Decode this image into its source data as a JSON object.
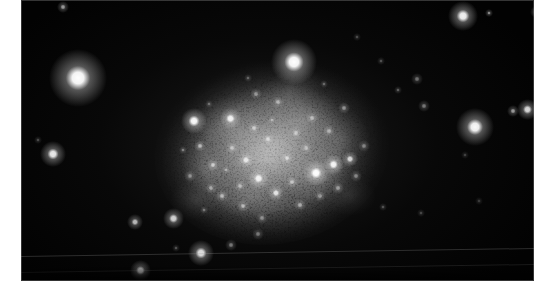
{
  "image": {
    "kind": "astronomical-photograph",
    "subject": "irregular dwarf galaxy resolved into individual stars",
    "caption": "",
    "width": 547,
    "height": 297,
    "colors": {
      "paper": "#ffffff",
      "sky": "#000000",
      "star": "#ffffff",
      "nebulosity": "#9a9a9a"
    }
  },
  "plate": {
    "left": 21,
    "top": 0,
    "width": 513,
    "height": 281
  },
  "chart_data": {
    "type": "scatter",
    "title": "",
    "xlabel": "",
    "ylabel": "",
    "xlim": [
      21,
      534
    ],
    "ylim": [
      0,
      281
    ],
    "grid": false,
    "legend": "none",
    "galaxy": {
      "name": "irregular dwarf galaxy",
      "center_x": 272,
      "center_y": 150,
      "semi_major_x": 105,
      "semi_minor_y": 82,
      "position_angle_deg": -12,
      "peak_surface_brightness": 0.42
    },
    "halos": [
      {
        "cx": 272,
        "cy": 150,
        "rx": 112,
        "ry": 88,
        "b": 0.2,
        "rot": -12
      },
      {
        "cx": 268,
        "cy": 148,
        "rx": 86,
        "ry": 66,
        "b": 0.26,
        "rot": -10
      },
      {
        "cx": 276,
        "cy": 146,
        "rx": 60,
        "ry": 48,
        "b": 0.28,
        "rot": -8
      },
      {
        "cx": 262,
        "cy": 160,
        "rx": 44,
        "ry": 34,
        "b": 0.26,
        "rot": 10
      },
      {
        "cx": 300,
        "cy": 120,
        "rx": 40,
        "ry": 30,
        "b": 0.22,
        "rot": -20
      },
      {
        "cx": 232,
        "cy": 128,
        "rx": 38,
        "ry": 30,
        "b": 0.22,
        "rot": 18
      },
      {
        "cx": 318,
        "cy": 172,
        "rx": 36,
        "ry": 28,
        "b": 0.24,
        "rot": -15
      },
      {
        "cx": 250,
        "cy": 196,
        "rx": 40,
        "ry": 24,
        "b": 0.18,
        "rot": 6
      },
      {
        "cx": 210,
        "cy": 168,
        "rx": 30,
        "ry": 26,
        "b": 0.18,
        "rot": 0
      },
      {
        "cx": 290,
        "cy": 92,
        "rx": 34,
        "ry": 22,
        "b": 0.16,
        "rot": -25
      },
      {
        "cx": 340,
        "cy": 140,
        "rx": 30,
        "ry": 30,
        "b": 0.15,
        "rot": 0
      },
      {
        "cx": 196,
        "cy": 200,
        "rx": 26,
        "ry": 20,
        "b": 0.13,
        "rot": 0
      },
      {
        "cx": 350,
        "cy": 196,
        "rx": 26,
        "ry": 20,
        "b": 0.11,
        "rot": 0
      }
    ],
    "field_stars": [
      {
        "cx": 78,
        "cy": 78,
        "r": 14,
        "b": 1.0
      },
      {
        "cx": 294,
        "cy": 62,
        "r": 11,
        "b": 1.0
      },
      {
        "cx": 53,
        "cy": 154,
        "r": 6,
        "b": 0.92
      },
      {
        "cx": 463,
        "cy": 16,
        "r": 7,
        "b": 0.95
      },
      {
        "cx": 489,
        "cy": 13,
        "r": 2,
        "b": 0.55
      },
      {
        "cx": 475,
        "cy": 127,
        "r": 9,
        "b": 0.98
      },
      {
        "cx": 527,
        "cy": 109,
        "r": 5,
        "b": 0.85
      },
      {
        "cx": 513,
        "cy": 111,
        "r": 3,
        "b": 0.6
      },
      {
        "cx": 536,
        "cy": 12,
        "r": 3,
        "b": 0.5
      },
      {
        "cx": 424,
        "cy": 106,
        "r": 3,
        "b": 0.45
      },
      {
        "cx": 417,
        "cy": 79,
        "r": 3,
        "b": 0.42
      },
      {
        "cx": 398,
        "cy": 90,
        "r": 2,
        "b": 0.35
      },
      {
        "cx": 381,
        "cy": 61,
        "r": 2,
        "b": 0.3
      },
      {
        "cx": 357,
        "cy": 37,
        "r": 2,
        "b": 0.28
      },
      {
        "cx": 383,
        "cy": 207,
        "r": 2,
        "b": 0.3
      },
      {
        "cx": 421,
        "cy": 213,
        "r": 2,
        "b": 0.26
      },
      {
        "cx": 465,
        "cy": 155,
        "r": 2,
        "b": 0.24
      },
      {
        "cx": 479,
        "cy": 201,
        "r": 2,
        "b": 0.22
      },
      {
        "cx": 135,
        "cy": 222,
        "r": 4,
        "b": 0.72
      },
      {
        "cx": 173,
        "cy": 218,
        "r": 5,
        "b": 0.82
      },
      {
        "cx": 201,
        "cy": 253,
        "r": 6,
        "b": 0.88
      },
      {
        "cx": 140,
        "cy": 270,
        "r": 5,
        "b": 0.7
      },
      {
        "cx": 231,
        "cy": 245,
        "r": 3,
        "b": 0.45
      },
      {
        "cx": 258,
        "cy": 234,
        "r": 3,
        "b": 0.42
      },
      {
        "cx": 176,
        "cy": 248,
        "r": 2,
        "b": 0.3
      },
      {
        "cx": 63,
        "cy": 7,
        "r": 3,
        "b": 0.6
      },
      {
        "cx": 38,
        "cy": 140,
        "r": 2,
        "b": 0.28
      }
    ],
    "resolved_stars": [
      {
        "cx": 194,
        "cy": 121,
        "r": 6,
        "b": 0.98
      },
      {
        "cx": 230,
        "cy": 118,
        "r": 5,
        "b": 0.92
      },
      {
        "cx": 316,
        "cy": 173,
        "r": 6,
        "b": 1.0
      },
      {
        "cx": 333,
        "cy": 164,
        "r": 5,
        "b": 0.94
      },
      {
        "cx": 350,
        "cy": 159,
        "r": 4,
        "b": 0.8
      },
      {
        "cx": 258,
        "cy": 178,
        "r": 5,
        "b": 0.9
      },
      {
        "cx": 276,
        "cy": 193,
        "r": 4,
        "b": 0.82
      },
      {
        "cx": 246,
        "cy": 160,
        "r": 4,
        "b": 0.78
      },
      {
        "cx": 213,
        "cy": 165,
        "r": 3,
        "b": 0.66
      },
      {
        "cx": 200,
        "cy": 146,
        "r": 3,
        "b": 0.62
      },
      {
        "cx": 222,
        "cy": 196,
        "r": 3,
        "b": 0.6
      },
      {
        "cx": 243,
        "cy": 206,
        "r": 3,
        "b": 0.58
      },
      {
        "cx": 300,
        "cy": 205,
        "r": 3,
        "b": 0.56
      },
      {
        "cx": 287,
        "cy": 158,
        "r": 3,
        "b": 0.64
      },
      {
        "cx": 268,
        "cy": 139,
        "r": 3,
        "b": 0.62
      },
      {
        "cx": 254,
        "cy": 128,
        "r": 3,
        "b": 0.58
      },
      {
        "cx": 296,
        "cy": 133,
        "r": 3,
        "b": 0.56
      },
      {
        "cx": 312,
        "cy": 118,
        "r": 3,
        "b": 0.54
      },
      {
        "cx": 329,
        "cy": 131,
        "r": 3,
        "b": 0.52
      },
      {
        "cx": 344,
        "cy": 108,
        "r": 3,
        "b": 0.5
      },
      {
        "cx": 278,
        "cy": 102,
        "r": 3,
        "b": 0.52
      },
      {
        "cx": 256,
        "cy": 94,
        "r": 3,
        "b": 0.48
      },
      {
        "cx": 232,
        "cy": 148,
        "r": 3,
        "b": 0.56
      },
      {
        "cx": 211,
        "cy": 188,
        "r": 3,
        "b": 0.5
      },
      {
        "cx": 190,
        "cy": 176,
        "r": 3,
        "b": 0.46
      },
      {
        "cx": 183,
        "cy": 150,
        "r": 2,
        "b": 0.42
      },
      {
        "cx": 338,
        "cy": 188,
        "r": 3,
        "b": 0.52
      },
      {
        "cx": 356,
        "cy": 176,
        "r": 3,
        "b": 0.46
      },
      {
        "cx": 320,
        "cy": 196,
        "r": 3,
        "b": 0.48
      },
      {
        "cx": 262,
        "cy": 218,
        "r": 3,
        "b": 0.44
      },
      {
        "cx": 292,
        "cy": 182,
        "r": 3,
        "b": 0.58
      },
      {
        "cx": 240,
        "cy": 186,
        "r": 3,
        "b": 0.52
      },
      {
        "cx": 272,
        "cy": 120,
        "r": 2,
        "b": 0.46
      },
      {
        "cx": 306,
        "cy": 148,
        "r": 3,
        "b": 0.54
      },
      {
        "cx": 226,
        "cy": 170,
        "r": 2,
        "b": 0.44
      },
      {
        "cx": 364,
        "cy": 146,
        "r": 3,
        "b": 0.44
      },
      {
        "cx": 204,
        "cy": 210,
        "r": 2,
        "b": 0.38
      },
      {
        "cx": 324,
        "cy": 84,
        "r": 2,
        "b": 0.36
      },
      {
        "cx": 248,
        "cy": 78,
        "r": 2,
        "b": 0.34
      },
      {
        "cx": 209,
        "cy": 104,
        "r": 2,
        "b": 0.36
      }
    ],
    "scratches": [
      {
        "x1": 21,
        "y1": 256,
        "x2": 534,
        "y2": 248,
        "b": 0.28
      },
      {
        "x1": 21,
        "y1": 272,
        "x2": 534,
        "y2": 264,
        "b": 0.16
      }
    ]
  }
}
